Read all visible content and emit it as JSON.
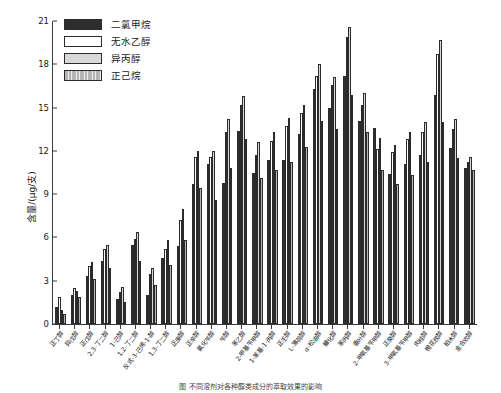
{
  "chart_data": {
    "type": "bar",
    "title": "",
    "xlabel": "",
    "ylabel": "含量/(μg/支)",
    "ylim": [
      0,
      21
    ],
    "yticks": [
      0,
      3,
      6,
      9,
      12,
      15,
      18,
      21
    ],
    "grid": false,
    "legend_position": "top-left",
    "categories": [
      "正丁醇",
      "异戊醇",
      "正戊醇",
      "2,3-丁二醇",
      "1-己醇",
      "1,2-丁二醇",
      "反式-3-己烯-1-醇",
      "1,3-丁二醇",
      "正庚醇",
      "正辛醇",
      "氯化苄醇",
      "苄醇",
      "苯乙醇",
      "2-甲基苄甲醇",
      "1-苯基-1-丙醇",
      "正壬醇",
      "L-薄荷醇",
      "α-松油醇",
      "糠化醇",
      "苯丙醇",
      "香叶醇",
      "2-甲氧基苄甲醇",
      "正癸醇",
      "3-甲氧基苄甲醇",
      "肉桂醇",
      "橙花叔醇",
      "柏木醇",
      "金合欢醇"
    ],
    "series": [
      {
        "name": "二氯甲烷",
        "color": "#2e2e2e",
        "pattern": "solid-dark",
        "values": [
          1.2,
          2.0,
          3.3,
          4.4,
          1.7,
          5.5,
          2.0,
          4.6,
          5.4,
          9.7,
          11.1,
          9.8,
          13.4,
          10.5,
          11.4,
          11.4,
          13.2,
          16.3,
          15.0,
          17.2,
          14.1,
          13.6,
          10.4,
          11.1,
          11.7,
          15.9,
          12.2,
          10.8
        ]
      },
      {
        "name": "无水乙醇",
        "color": "#ffffff",
        "pattern": "fine-dots",
        "values": [
          1.9,
          2.5,
          4.0,
          5.2,
          2.2,
          5.9,
          3.5,
          5.2,
          7.2,
          11.6,
          11.6,
          13.3,
          15.2,
          11.7,
          12.7,
          13.7,
          14.6,
          17.2,
          16.6,
          19.9,
          15.2,
          12.1,
          11.9,
          12.8,
          13.3,
          18.7,
          13.5,
          11.2
        ]
      },
      {
        "name": "异丙醇",
        "color": "#d8d8d8",
        "pattern": "coarse-dots",
        "values": [
          1.0,
          2.3,
          4.3,
          5.5,
          2.6,
          6.4,
          3.9,
          5.8,
          8.0,
          12.0,
          12.0,
          14.2,
          15.8,
          12.6,
          13.3,
          14.3,
          15.2,
          18.0,
          17.1,
          20.6,
          16.0,
          12.9,
          12.4,
          13.3,
          14.0,
          19.7,
          14.2,
          11.6
        ]
      },
      {
        "name": "正己烷",
        "color": "#b5b5b5",
        "pattern": "vertical-lines",
        "values": [
          0.7,
          1.9,
          3.1,
          3.9,
          1.5,
          4.4,
          2.7,
          4.1,
          5.8,
          9.4,
          8.6,
          10.8,
          12.8,
          10.1,
          10.7,
          11.2,
          12.3,
          14.1,
          13.5,
          15.9,
          13.3,
          10.7,
          9.7,
          10.3,
          11.2,
          14.0,
          11.5,
          10.7
        ]
      }
    ]
  },
  "legend": {
    "items": [
      {
        "label": "二氯甲烷"
      },
      {
        "label": "无水乙醇"
      },
      {
        "label": "异丙醇"
      },
      {
        "label": "正己烷"
      }
    ]
  },
  "caption": "图    不同溶剂对各种醇类成分的萃取效果的影响"
}
